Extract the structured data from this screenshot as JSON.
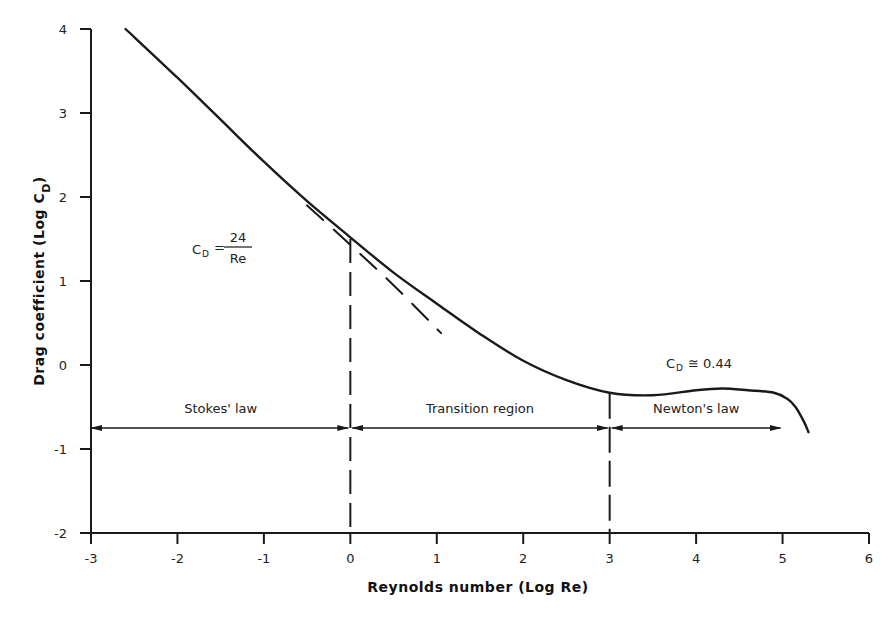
{
  "chart_data": {
    "type": "line",
    "title": "",
    "xlabel": "Reynolds number (Log Re)",
    "ylabel": "Drag coefficient (Log C",
    "ylabel_subscript": "D",
    "ylabel_close": ")",
    "xlim": [
      -3,
      6
    ],
    "ylim": [
      -2,
      4
    ],
    "grid": false,
    "legend": null,
    "x_ticks": [
      "-3",
      "-2",
      "-1",
      "0",
      "1",
      "2",
      "3",
      "4",
      "5",
      "6"
    ],
    "y_ticks": [
      "-2",
      "-1",
      "0",
      "1",
      "2",
      "3",
      "4"
    ],
    "series": [
      {
        "name": "Drag curve (sphere)",
        "style": "solid",
        "x": [
          -2.6,
          -2.0,
          -1.5,
          -1.0,
          -0.5,
          0.0,
          0.5,
          1.0,
          1.5,
          2.0,
          2.5,
          3.0,
          3.5,
          4.0,
          4.3,
          4.6,
          4.9,
          5.05,
          5.15,
          5.25,
          5.3
        ],
        "y": [
          4.0,
          3.42,
          2.92,
          2.42,
          1.95,
          1.52,
          1.1,
          0.73,
          0.37,
          0.05,
          -0.18,
          -0.33,
          -0.36,
          -0.3,
          -0.28,
          -0.3,
          -0.33,
          -0.4,
          -0.5,
          -0.68,
          -0.8
        ]
      },
      {
        "name": "Stokes' law extrapolation (C_D = 24/Re)",
        "style": "dashed",
        "x": [
          -0.5,
          0.0,
          0.5,
          1.05
        ],
        "y": [
          1.9,
          1.43,
          0.95,
          0.38
        ]
      }
    ],
    "annotations": [
      {
        "text_main": "C",
        "text_sub": "D",
        "text_eq": "=",
        "numerator": "24",
        "denominator": "Re",
        "x": -1.7,
        "y": 1.95
      },
      {
        "text_main": "C",
        "text_sub": "D",
        "text_eq": "≅ 0.44",
        "x": 3.6,
        "y": -0.4
      }
    ],
    "regions": [
      {
        "label": "Stokes' law",
        "x_start": -3,
        "x_end": 0,
        "arrow_y": -0.75
      },
      {
        "label": "Transition region",
        "x_start": 0,
        "x_end": 3,
        "arrow_y": -0.75
      },
      {
        "label": "Newton's law",
        "x_start": 3,
        "x_end": 5,
        "arrow_y": -0.75
      }
    ],
    "boundaries": [
      {
        "x": 0,
        "style": "dashed",
        "y_top": 1.5
      },
      {
        "x": 3,
        "style": "dashed",
        "y_top": -0.33
      }
    ]
  }
}
